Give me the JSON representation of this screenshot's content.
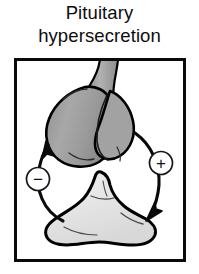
{
  "figure": {
    "title": {
      "line1": "Pituitary",
      "line2": "hypersecretion"
    },
    "panel": {
      "border_color": "#0a0a0a",
      "background": "#ffffff",
      "diagram_type": "feedback-loop",
      "nodes": [
        {
          "id": "pituitary-gland",
          "label": "pituitary gland",
          "position": "top",
          "fill_color": "#9d9d9d",
          "outline_color": "#000000",
          "description": "enlarged bilobed pituitary gland with infundibular stalk"
        },
        {
          "id": "target-gland",
          "label": "target gland",
          "position": "bottom",
          "fill_color": "#e8e8e8",
          "outline_color": "#000000",
          "description": "triangular lobed target endocrine gland"
        }
      ],
      "arrows": [
        {
          "id": "stimulatory-arrow",
          "label": "+",
          "sign": "plus",
          "from": "pituitary-gland",
          "to": "target-gland",
          "side": "right",
          "direction": "downward",
          "badge_fill": "#ffffff",
          "badge_stroke": "#111111"
        },
        {
          "id": "inhibitory-arrow",
          "label": "−",
          "sign": "minus",
          "from": "target-gland",
          "to": "pituitary-gland",
          "side": "left",
          "direction": "upward",
          "badge_fill": "#ffffff",
          "badge_stroke": "#111111"
        }
      ]
    }
  }
}
